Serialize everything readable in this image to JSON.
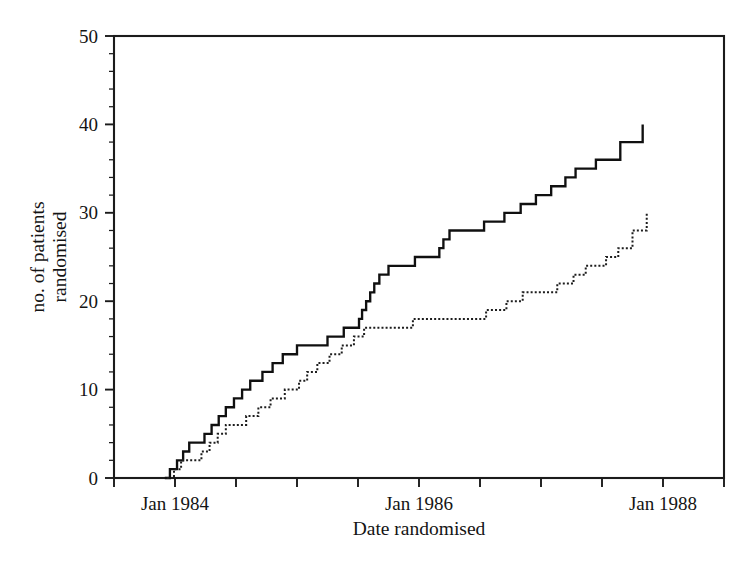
{
  "chart_data": {
    "type": "line",
    "title": "",
    "subtitle": "",
    "xlabel": "Date randomised",
    "ylabel": "no. of patients randomised",
    "ylabel_line1": "no. of patients",
    "ylabel_line2": "randomised",
    "grid": false,
    "legend_position": "none",
    "plot_style": "step-post cumulative recruitment curves",
    "ylim": [
      0,
      50
    ],
    "y_ticks_major": [
      0,
      10,
      20,
      30,
      40,
      50
    ],
    "y_tick_labels": [
      "0",
      "10",
      "20",
      "30",
      "40",
      "50"
    ],
    "y_tick_minor_step": 2,
    "xlim": [
      "1983-07-01",
      "1988-07-01"
    ],
    "x_ticks_major_labels": [
      "Jan 1984",
      "Jan 1986",
      "Jan 1988"
    ],
    "x_ticks_major_dates": [
      "1984-01-01",
      "1986-01-01",
      "1988-01-01"
    ],
    "x_ticks_all_dates": [
      "1983-07-01",
      "1984-01-01",
      "1984-07-01",
      "1985-01-01",
      "1985-07-01",
      "1986-01-01",
      "1986-07-01",
      "1987-01-01",
      "1987-07-01",
      "1988-01-01",
      "1988-07-01"
    ],
    "x_unit": "months since 1983-07-01",
    "series": [
      {
        "name": "solid line series",
        "style": "solid",
        "final_value": 40,
        "points_months": [
          5.0,
          5.5,
          6.2,
          6.8,
          7.4,
          8.2,
          8.9,
          9.6,
          10.3,
          11.0,
          11.8,
          12.6,
          13.4,
          14.6,
          15.6,
          16.6,
          18.0,
          19.6,
          21.0,
          22.6,
          24.1,
          24.4,
          24.8,
          25.2,
          25.6,
          26.1,
          27.0,
          29.6,
          31.2,
          32.0,
          32.4,
          33.0,
          36.4,
          38.4,
          40.0,
          41.5,
          43.0,
          44.4,
          45.4,
          47.4,
          49.8,
          52.0
        ],
        "points_values": [
          0,
          1,
          2,
          3,
          4,
          4,
          5,
          6,
          7,
          8,
          9,
          10,
          11,
          12,
          13,
          14,
          15,
          15,
          16,
          17,
          18,
          19,
          20,
          21,
          22,
          23,
          24,
          25,
          25,
          26,
          27,
          28,
          29,
          30,
          31,
          32,
          33,
          34,
          35,
          36,
          38,
          40
        ]
      },
      {
        "name": "dotted line series",
        "style": "dotted",
        "final_value": 30,
        "points_months": [
          5.2,
          5.9,
          6.6,
          8.6,
          9.4,
          10.2,
          11.0,
          13.0,
          14.2,
          15.4,
          16.8,
          18.2,
          19.0,
          20.0,
          21.2,
          22.4,
          23.6,
          24.6,
          29.4,
          31.0,
          36.6,
          38.6,
          40.2,
          43.6,
          45.2,
          46.4,
          48.4,
          49.6,
          51.0,
          52.4
        ],
        "points_values": [
          0,
          1,
          2,
          3,
          4,
          5,
          6,
          7,
          8,
          9,
          10,
          11,
          12,
          13,
          14,
          15,
          16,
          17,
          18,
          18,
          19,
          20,
          21,
          22,
          23,
          24,
          25,
          26,
          28,
          30
        ]
      }
    ]
  }
}
